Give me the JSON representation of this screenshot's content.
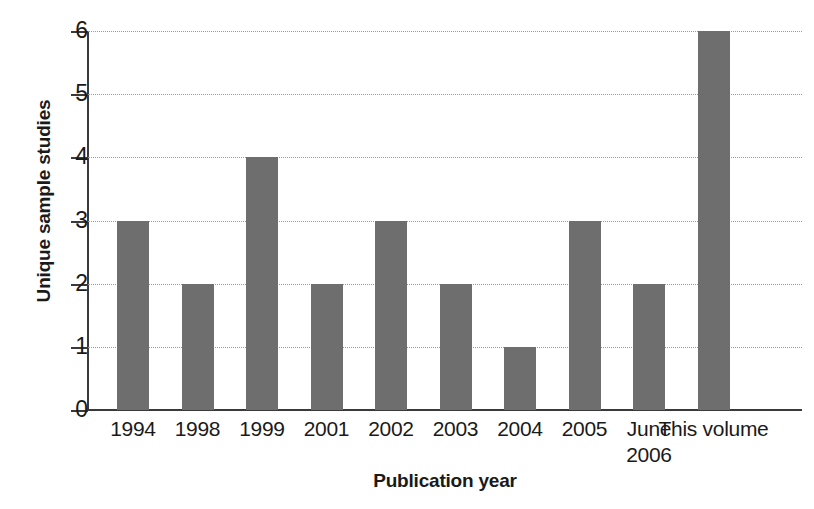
{
  "figure": {
    "caption_remnant": "",
    "background_color": "#ffffff",
    "bar_color": "#6e6e6e",
    "gridline_color": "#9a9a9a",
    "axis_color": "#3a3a3a"
  },
  "chart_data": {
    "type": "bar",
    "title": "",
    "xlabel": "Publication year",
    "ylabel": "Unique sample studies",
    "categories": [
      "1994",
      "1998",
      "1999",
      "2001",
      "2002",
      "2003",
      "2004",
      "2005",
      "June\n2006",
      "This volume"
    ],
    "values": [
      3,
      2,
      4,
      2,
      3,
      2,
      1,
      3,
      2,
      6
    ],
    "ylim": [
      0,
      6
    ],
    "yticks": [
      0,
      1,
      2,
      3,
      4,
      5,
      6
    ],
    "ytick_labels": [
      "0",
      "1",
      "2",
      "3",
      "4",
      "5",
      "6"
    ],
    "grid": true,
    "grid_axis": "y",
    "grid_style": "dotted",
    "legend": false,
    "legend_position": "none"
  }
}
